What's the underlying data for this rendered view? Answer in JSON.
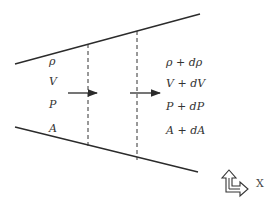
{
  "diagram": {
    "inlet_labels": [
      "ρ",
      "V",
      "P",
      "A"
    ],
    "outlet_labels": [
      "ρ + dρ",
      "V + dV",
      "P + dP",
      "A + dA"
    ],
    "axis_label": "X",
    "colors": {
      "line": "#2b2b2b",
      "text": "#333333",
      "background": "#ffffff"
    }
  }
}
